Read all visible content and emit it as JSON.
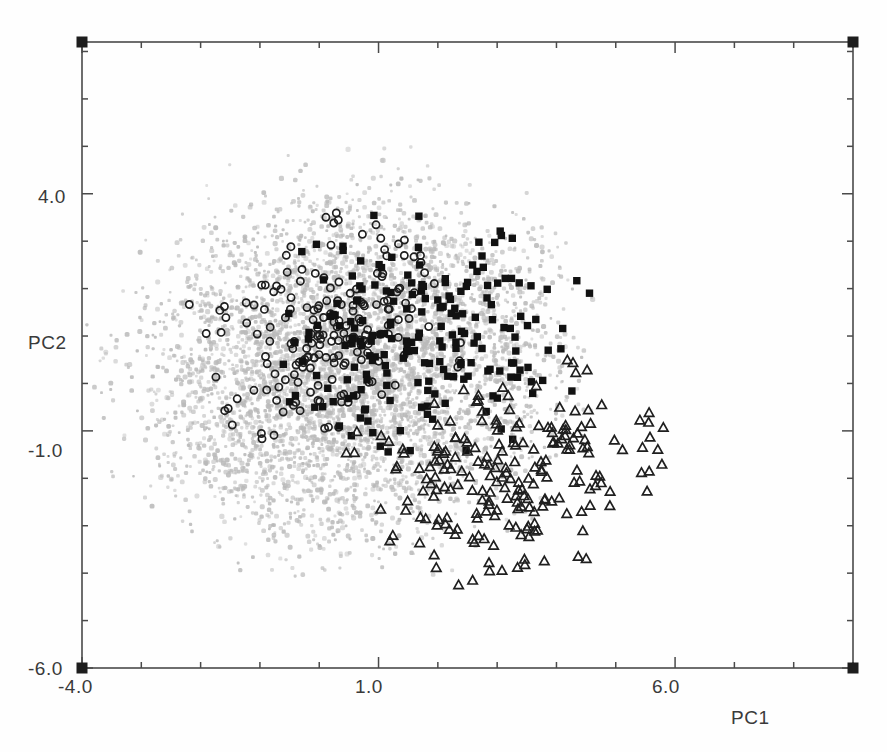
{
  "chart_data": {
    "type": "scatter",
    "title": "",
    "xlabel": "PC1",
    "ylabel": "PC2",
    "xlim": [
      -4.0,
      9.0
    ],
    "ylim": [
      -6.0,
      7.2
    ],
    "xticks": [
      -4.0,
      1.0,
      6.0
    ],
    "xticklabels": [
      "-4.0",
      "1.0",
      "6.0"
    ],
    "yticks": [
      4.0,
      -1.0,
      -6.0
    ],
    "yticklabels": [
      "4.0",
      "-1.0",
      "-6.0"
    ],
    "grid": false,
    "legend": "none",
    "minor_ticks_per_major": 5,
    "frame": "box",
    "corner_markers": "filled-square",
    "series": [
      {
        "name": "background-cloud",
        "marker": "small-dot",
        "color": "#b9b9b9",
        "size": 3.6,
        "n": 5200,
        "center": [
          0.55,
          0.35
        ],
        "spread": [
          1.85,
          1.95
        ],
        "note": "large diffuse gray point cloud forming elliptical mass skewed lower-left"
      },
      {
        "name": "open-circles",
        "marker": "circle-open",
        "color": "#1f1f1f",
        "size": 7.2,
        "n": 205,
        "center": [
          0.05,
          1.15
        ],
        "spread": [
          1.05,
          1.15
        ],
        "note": "open circle group concentrated upper-left of core"
      },
      {
        "name": "filled-squares",
        "marker": "square-filled",
        "color": "#111111",
        "size": 7.4,
        "n": 215,
        "center": [
          1.75,
          0.85
        ],
        "spread": [
          1.35,
          1.25
        ],
        "note": "solid black square group occupying central band"
      },
      {
        "name": "open-triangles",
        "marker": "triangle-open",
        "color": "#1f1f1f",
        "size": 8.4,
        "n": 230,
        "center": [
          3.15,
          -1.95
        ],
        "spread": [
          1.25,
          1.15
        ],
        "note": "open triangle group concentrated lower-right"
      }
    ]
  },
  "axes": {
    "x_label": "PC1",
    "y_label": "PC2",
    "x_tick_labels": [
      "-4.0",
      "1.0",
      "6.0"
    ],
    "y_tick_labels": [
      "4.0",
      "-1.0",
      "-6.0"
    ]
  },
  "colors": {
    "background_points": "#b9b9b9",
    "circles": "#1f1f1f",
    "squares": "#111111",
    "triangles": "#1f1f1f",
    "axis": "#4a4a4a",
    "text": "#3a3a3a",
    "page": "#fefefe"
  }
}
